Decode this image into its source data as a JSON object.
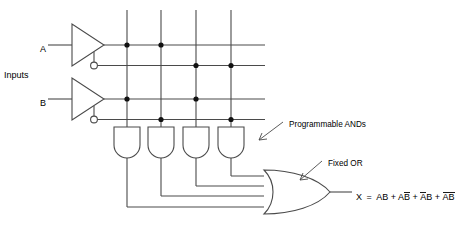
{
  "diagram": {
    "colors": {
      "background": "#ffffff",
      "wire": "#4a4a4a",
      "dot": "#111111",
      "text": "#1a1a1a"
    },
    "labels": {
      "input_a": "A",
      "input_b": "B",
      "inputs_group": "Inputs",
      "programmable_ands": "Programmable ANDs",
      "fixed_or": "Fixed OR"
    },
    "equation": {
      "output_name": "X",
      "equals": "=",
      "plus": "+",
      "full_text": "X = AB + AB̅ + A̅B + A̅B̅",
      "terms": [
        {
          "text": "AB",
          "a_bar": false,
          "b_bar": false
        },
        {
          "text": "AB",
          "a_bar": false,
          "b_bar": true
        },
        {
          "text": "AB",
          "a_bar": true,
          "b_bar": false
        },
        {
          "text": "AB",
          "a_bar": true,
          "b_bar": true
        }
      ]
    },
    "buffers": [
      {
        "name": "buffer-a",
        "input": "A",
        "true_line": "A",
        "complement_line": "A-bar"
      },
      {
        "name": "buffer-b",
        "input": "B",
        "true_line": "B",
        "complement_line": "B-bar"
      }
    ],
    "rails": [
      {
        "index": 0,
        "signal": "A"
      },
      {
        "index": 1,
        "signal": "A-bar"
      },
      {
        "index": 2,
        "signal": "B"
      },
      {
        "index": 3,
        "signal": "B-bar"
      }
    ],
    "and_gates": [
      {
        "index": 0,
        "product": "AB",
        "connected_rails": [
          0,
          2
        ]
      },
      {
        "index": 1,
        "product": "ABbar",
        "connected_rails": [
          0,
          3
        ]
      },
      {
        "index": 2,
        "product": "AbarB",
        "connected_rails": [
          1,
          2
        ]
      },
      {
        "index": 3,
        "product": "AbarBbar",
        "connected_rails": [
          1,
          3
        ]
      }
    ],
    "or_gate": {
      "name": "fixed-or-gate",
      "input_count": 4,
      "output": "X"
    }
  }
}
